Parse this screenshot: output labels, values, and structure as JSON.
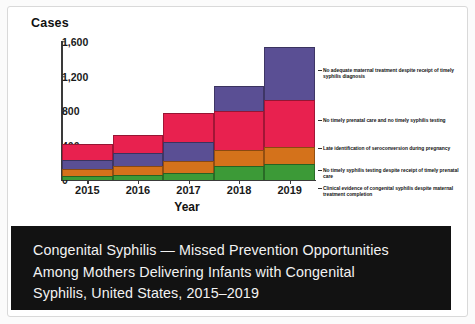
{
  "chart_data": {
    "type": "bar",
    "subtype": "stacked-step-column",
    "title": "Congenital Syphilis — Missed Prevention Opportunities Among Mothers Delivering Infants with Congenital Syphilis, United States, 2015–2019",
    "xlabel": "Year",
    "ylabel": "Cases",
    "categories": [
      "2015",
      "2016",
      "2017",
      "2018",
      "2019"
    ],
    "ylim": [
      0,
      1600
    ],
    "yticks": [
      "0",
      "400",
      "800",
      "1,200",
      "1,600"
    ],
    "ytick_values": [
      0,
      400,
      800,
      1200,
      1600
    ],
    "grid": false,
    "legend_position": "right-inline-annotations",
    "series": [
      {
        "name": "Clinical evidence of congenital syphilis despite maternal treatment completion",
        "color": "#3c9a37",
        "values": [
          50,
          62,
          80,
          160,
          190
        ]
      },
      {
        "name": "No timely syphilis testing despite receipt of timely prenatal care",
        "color": "#d4721b",
        "values": [
          75,
          100,
          140,
          185,
          195
        ]
      },
      {
        "name": "Late identification of seroconversion during pregnancy",
        "color": "#5a4f94",
        "values": [
          110,
          150,
          225,
          0,
          0
        ]
      },
      {
        "name": "No timely prenatal care and no timely syphilis testing",
        "color": "#e8214f",
        "values": [
          185,
          210,
          330,
          455,
          545
        ]
      },
      {
        "name": "No adequate maternal treatment despite receipt of timely syphilis diagnosis",
        "color": "#5a4f94",
        "values": [
          0,
          0,
          0,
          290,
          610
        ]
      }
    ],
    "totals": [
      420,
      522,
      775,
      1090,
      1540
    ]
  },
  "chart": {
    "y_axis_title": "Cases",
    "x_axis_title": "Year",
    "y_ticks": [
      "1,600",
      "1,200",
      "800",
      "400",
      "0"
    ],
    "x_ticks": [
      "2015",
      "2016",
      "2017",
      "2018",
      "2019"
    ]
  },
  "annotations": [
    {
      "id": "no-adequate-maternal-treatment",
      "text": "No adequate maternal treatment despite receipt of timely syphilis diagnosis"
    },
    {
      "id": "no-timely-prenatal-care",
      "text": "No timely prenatal care and no timely syphilis testing"
    },
    {
      "id": "late-identification-seroconversion",
      "text": "Late identification of seroconversion during pregnancy"
    },
    {
      "id": "no-timely-syphilis-testing",
      "text": "No timely syphilis testing despite receipt of timely prenatal care"
    },
    {
      "id": "clinical-evidence-congenital-syphilis",
      "text": "Clinical evidence of congenital syphilis despite maternal treatment completion"
    }
  ],
  "caption": {
    "line1": "Congenital Syphilis — Missed Prevention Opportunities",
    "line2": "Among Mothers Delivering Infants with Congenital",
    "line3": "Syphilis, United States, 2015–2019"
  },
  "colors": {
    "purple": "#5a4f94",
    "crimson": "#e8214f",
    "orange": "#d4721b",
    "green": "#3c9a37",
    "caption_bg": "#121212",
    "caption_text": "#f2f2f2"
  }
}
